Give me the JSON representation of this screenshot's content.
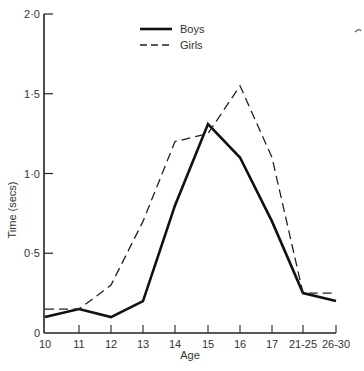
{
  "chart_data": {
    "type": "line",
    "title": "",
    "xlabel": "Age",
    "ylabel": "Time (secs)",
    "categories": [
      "10",
      "11",
      "12",
      "13",
      "14",
      "15",
      "16",
      "17",
      "21-25",
      "26-30"
    ],
    "series": [
      {
        "name": "Boys",
        "style": "solid",
        "color": "#111111",
        "values": [
          0.1,
          0.15,
          0.1,
          0.2,
          0.8,
          1.31,
          1.1,
          0.7,
          0.25,
          0.2
        ]
      },
      {
        "name": "Girls",
        "style": "dashed",
        "color": "#222222",
        "values": [
          0.15,
          0.15,
          0.3,
          0.7,
          1.2,
          1.25,
          1.55,
          1.1,
          0.25,
          0.25
        ]
      }
    ],
    "ylim": [
      0,
      2.0
    ],
    "yticks": [
      {
        "value": 0,
        "label": "0"
      },
      {
        "value": 0.5,
        "label": "0·5"
      },
      {
        "value": 1.0,
        "label": "1·0"
      },
      {
        "value": 1.5,
        "label": "1·5"
      },
      {
        "value": 2.0,
        "label": "2·0"
      }
    ],
    "grid": false,
    "legend_position": "top-center"
  }
}
